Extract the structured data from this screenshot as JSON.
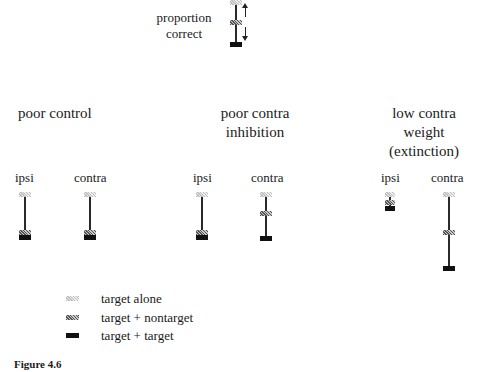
{
  "key": {
    "label_line1": "proportion",
    "label_line2": "correct"
  },
  "panels": [
    {
      "title_lines": [
        "poor control"
      ],
      "columns": [
        {
          "label": "ipsi"
        },
        {
          "label": "contra"
        }
      ]
    },
    {
      "title_lines": [
        "poor contra",
        "inhibition"
      ],
      "columns": [
        {
          "label": "ipsi"
        },
        {
          "label": "contra"
        }
      ]
    },
    {
      "title_lines": [
        "low contra",
        "weight",
        "(extinction)"
      ],
      "columns": [
        {
          "label": "ipsi"
        },
        {
          "label": "contra"
        }
      ]
    }
  ],
  "legend": [
    {
      "label": "target alone",
      "marker": "light-hatched"
    },
    {
      "label": "target + nontarget",
      "marker": "dark-hatched"
    },
    {
      "label": "target + target",
      "marker": "solid-black"
    }
  ],
  "caption": "Figure 4.6",
  "colors": {
    "line": "#2a2a2a",
    "target_target": "#111111",
    "nontarget": "#555555",
    "alone": "#bdbdbd"
  }
}
